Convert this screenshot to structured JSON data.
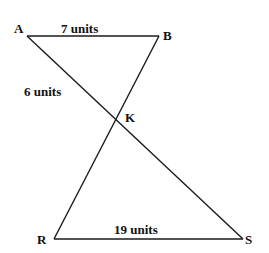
{
  "diagram": {
    "points": {
      "A": {
        "label": "A",
        "x": 27,
        "y": 36
      },
      "B": {
        "label": "B",
        "x": 159,
        "y": 36
      },
      "K": {
        "label": "K",
        "x": 116,
        "y": 118
      },
      "R": {
        "label": "R",
        "x": 54,
        "y": 239
      },
      "S": {
        "label": "S",
        "x": 243,
        "y": 239
      }
    },
    "segments": [
      {
        "from": "A",
        "to": "B"
      },
      {
        "from": "A",
        "to": "S"
      },
      {
        "from": "B",
        "to": "R"
      },
      {
        "from": "R",
        "to": "S"
      }
    ],
    "measurements": {
      "AB": "7 units",
      "AK": "6 units",
      "RS": "19 units"
    }
  }
}
